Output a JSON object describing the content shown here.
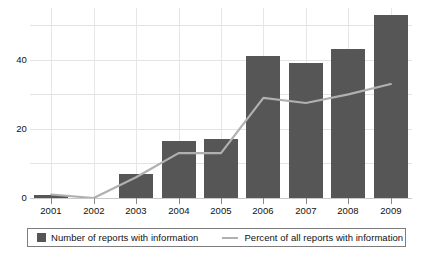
{
  "chart_data": {
    "type": "bar",
    "title": "",
    "subtitle": "",
    "xlabel": "",
    "ylabel": "",
    "categories": [
      "2001",
      "2002",
      "2003",
      "2004",
      "2005",
      "2006",
      "2007",
      "2008",
      "2009"
    ],
    "ylim": [
      0,
      55
    ],
    "yticks": [
      0,
      20,
      40
    ],
    "ytick_labels": [
      "0",
      "20",
      "40"
    ],
    "gridlines_y": [
      0,
      10,
      20,
      30,
      40,
      50
    ],
    "grid": true,
    "legend_position": "bottom",
    "series": [
      {
        "name": "Number of reports with information",
        "type": "bar",
        "color": "#565656",
        "values": [
          1,
          0,
          7,
          16.5,
          17,
          41,
          39,
          43,
          53
        ]
      },
      {
        "name": "Percent of all reports with information",
        "type": "line",
        "color": "#b0b0b0",
        "values": [
          1,
          0,
          6,
          13,
          13,
          29,
          27.5,
          30,
          33
        ]
      }
    ]
  },
  "legend": {
    "entries": [
      {
        "label": "Number of reports with information",
        "marker": "square-swatch",
        "color": "#565656"
      },
      {
        "label": "Percent of all reports with information",
        "marker": "line-swatch",
        "color": "#b0b0b0"
      }
    ]
  },
  "colors": {
    "bar": "#565656",
    "line": "#b0b0b0",
    "grid": "#e3e3e3",
    "axis": "#c9c9c9",
    "background": "#ffffff",
    "text": "#111111"
  }
}
